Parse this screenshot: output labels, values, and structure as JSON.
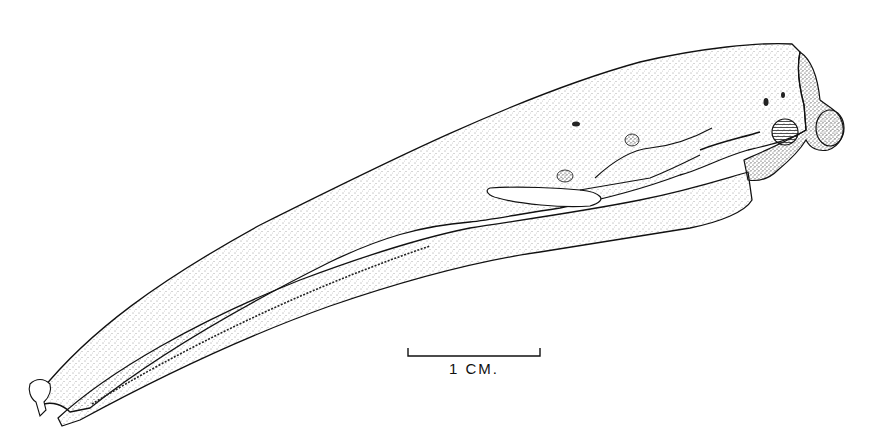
{
  "figure": {
    "style": "stippled pen-and-ink",
    "colors": {
      "ink": "#111111",
      "paper": "#ffffff"
    }
  },
  "scale_bar": {
    "label": "1 CM.",
    "length_px": 132
  }
}
